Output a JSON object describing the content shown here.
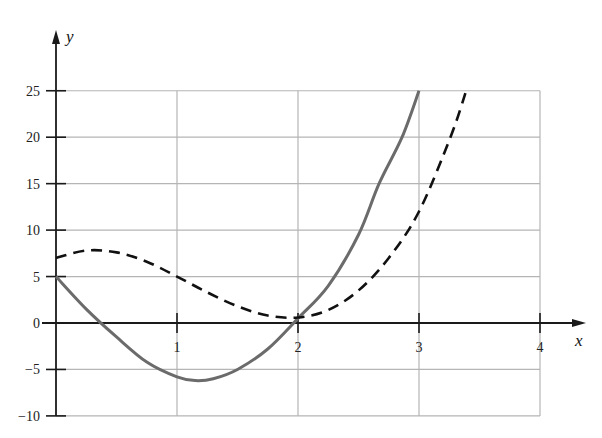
{
  "chart_data": {
    "type": "line",
    "title": "",
    "xlabel": "x",
    "ylabel": "y",
    "xlim": [
      0,
      4
    ],
    "ylim": [
      -10,
      25
    ],
    "grid": true,
    "legend": null,
    "x_ticks": [
      1,
      2,
      3,
      4
    ],
    "x_tick_labels": [
      "1",
      "2",
      "3",
      "4"
    ],
    "y_ticks": [
      -10,
      -5,
      0,
      5,
      10,
      15,
      20,
      25
    ],
    "y_tick_labels": [
      "−10",
      "−5",
      "0",
      "5",
      "10",
      "15",
      "20",
      "25"
    ],
    "series": [
      {
        "name": "solid curve",
        "style": "solid",
        "color": "#6b6b6b",
        "x": [
          0,
          0.25,
          0.5,
          0.75,
          1,
          1.15,
          1.3,
          1.5,
          1.75,
          2,
          2.25,
          2.5,
          2.67,
          2.86,
          3
        ],
        "y": [
          5,
          1.5,
          -1.5,
          -4.2,
          -5.8,
          -6.2,
          -6.0,
          -5,
          -2.8,
          0.5,
          4,
          9.5,
          15,
          20,
          25
        ]
      },
      {
        "name": "dashed curve",
        "style": "dashed",
        "color": "#111111",
        "x": [
          0,
          0.25,
          0.5,
          0.75,
          1,
          1.25,
          1.5,
          1.75,
          2,
          2.25,
          2.5,
          2.75,
          3,
          3.26,
          3.39
        ],
        "y": [
          7,
          7.8,
          7.6,
          6.6,
          5,
          3.3,
          1.8,
          0.8,
          0.6,
          1.4,
          3.5,
          7,
          12,
          20,
          25
        ]
      }
    ]
  },
  "layout": {
    "origin_px": [
      56,
      323
    ],
    "px_per_x": 121,
    "px_per_y": 9.29,
    "grid_color": "#b5b5b5",
    "axis_color": "#1a1a1a"
  }
}
